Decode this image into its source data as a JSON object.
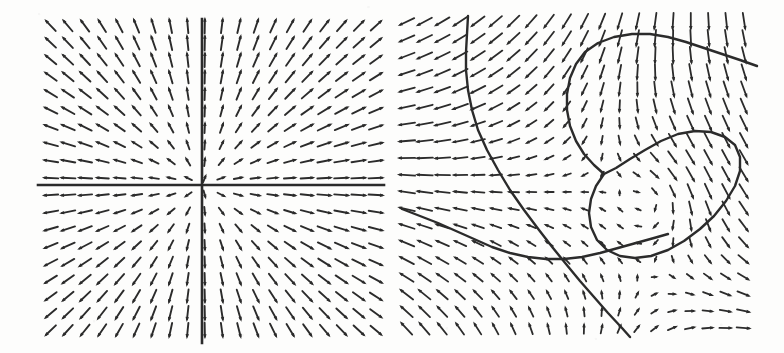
{
  "figure": {
    "kind": "direction-field-pair",
    "background_color": "#fdfdfc",
    "ink_color": "#2b2b2b",
    "width": 784,
    "height": 353,
    "caption": "",
    "title": ""
  },
  "panels": [
    {
      "id": "left",
      "name": "saddle-direction-field",
      "label": "",
      "plot_box": {
        "x": 44,
        "y": 20,
        "w": 336,
        "h": 317
      },
      "axes": {
        "shown": true,
        "x_axis": {
          "y": 185,
          "x_start": 38,
          "x_end": 384,
          "label": ""
        },
        "y_axis": {
          "x": 202,
          "y_start": 19,
          "y_end": 343,
          "label": ""
        }
      },
      "grid": {
        "cols": 20,
        "rows": 19,
        "spacing_x": 17.2,
        "spacing_y": 17.0
      },
      "arrow": {
        "length": 14,
        "head_length": 5,
        "head_width": 3.4,
        "stroke_width": 1.9
      },
      "curves": []
    },
    {
      "id": "right",
      "name": "nonlinear-direction-field-with-trajectories",
      "label": "",
      "plot_box": {
        "x": 402,
        "y": 18,
        "w": 354,
        "h": 318
      },
      "axes": {
        "shown": false
      },
      "grid": {
        "cols": 20,
        "rows": 19,
        "spacing_x": 17.8,
        "spacing_y": 17.0
      },
      "arrow": {
        "length": 14,
        "head_length": 5,
        "head_width": 3.4,
        "stroke_width": 1.8
      },
      "curves": [
        {
          "name": "descending-separatrix",
          "stroke_width": 2.4,
          "points": [
            [
              468,
              16
            ],
            [
              467,
              34
            ],
            [
              466,
              52
            ],
            [
              466,
              70
            ],
            [
              468,
              90
            ],
            [
              472,
              110
            ],
            [
              478,
              130
            ],
            [
              487,
              150
            ],
            [
              498,
              170
            ],
            [
              510,
              190
            ],
            [
              524,
              210
            ],
            [
              539,
              230
            ],
            [
              553,
              248
            ],
            [
              566,
              264
            ],
            [
              580,
              281
            ],
            [
              594,
              297
            ],
            [
              608,
              313
            ],
            [
              622,
              328
            ],
            [
              630,
              337
            ]
          ]
        },
        {
          "name": "upper-hook-curve",
          "stroke_width": 2.4,
          "points": [
            [
              757,
              66
            ],
            [
              740,
              60
            ],
            [
              722,
              54
            ],
            [
              704,
              48
            ],
            [
              686,
              42
            ],
            [
              668,
              37
            ],
            [
              650,
              34
            ],
            [
              632,
              34
            ],
            [
              614,
              37
            ],
            [
              598,
              43
            ],
            [
              585,
              52
            ],
            [
              576,
              64
            ],
            [
              570,
              78
            ],
            [
              567,
              94
            ],
            [
              567,
              110
            ],
            [
              570,
              126
            ],
            [
              576,
              141
            ],
            [
              584,
              154
            ],
            [
              594,
              165
            ],
            [
              604,
              174
            ]
          ]
        },
        {
          "name": "closed-loop-curve",
          "stroke_width": 2.4,
          "closed": true,
          "points": [
            [
              604,
              174
            ],
            [
              596,
              186
            ],
            [
              591,
              199
            ],
            [
              589,
              213
            ],
            [
              591,
              227
            ],
            [
              597,
              240
            ],
            [
              607,
              250
            ],
            [
              620,
              256
            ],
            [
              635,
              258
            ],
            [
              651,
              256
            ],
            [
              668,
              250
            ],
            [
              684,
              241
            ],
            [
              700,
              229
            ],
            [
              714,
              216
            ],
            [
              726,
              201
            ],
            [
              735,
              186
            ],
            [
              740,
              171
            ],
            [
              740,
              157
            ],
            [
              735,
              145
            ],
            [
              725,
              137
            ],
            [
              711,
              132
            ],
            [
              695,
              131
            ],
            [
              678,
              134
            ],
            [
              661,
              141
            ],
            [
              645,
              150
            ],
            [
              630,
              159
            ],
            [
              616,
              168
            ],
            [
              604,
              174
            ]
          ]
        },
        {
          "name": "lower-left-incoming-curve",
          "stroke_width": 2.4,
          "points": [
            [
              402,
              209
            ],
            [
              420,
              216
            ],
            [
              438,
              223
            ],
            [
              456,
              231
            ],
            [
              474,
              239
            ],
            [
              492,
              247
            ],
            [
              510,
              253
            ],
            [
              528,
              257
            ],
            [
              546,
              259
            ],
            [
              564,
              259
            ],
            [
              582,
              257
            ],
            [
              600,
              253
            ],
            [
              618,
              248
            ],
            [
              636,
              243
            ],
            [
              654,
              238
            ],
            [
              668,
              234
            ]
          ]
        }
      ]
    }
  ],
  "chart_data": {
    "type": "scatter",
    "title": "",
    "xlabel": "",
    "ylabel": "",
    "panels": [
      {
        "panel": "left",
        "type": "vector-field",
        "axes_drawn": true,
        "origin_px": [
          202,
          185
        ],
        "grid_cols": 20,
        "grid_rows": 19,
        "field_model": "dx/dt = x, dy/dt = -y (saddle)",
        "quadrant_flow": {
          "upper_left": "down and left (arrows point left-downward)",
          "upper_right": "down and right (arrows point right-downward)",
          "lower_left": "up and left (arrows point left-upward)",
          "lower_right": "up and right (arrows point right-upward)"
        },
        "on_axis_behavior": {
          "x_axis": "arrows horizontal, pointing outward away from origin",
          "y_axis": "arrows vertical, pointing inward toward origin"
        }
      },
      {
        "panel": "right",
        "type": "vector-field-with-trajectories",
        "axes_drawn": false,
        "grid_cols": 20,
        "grid_rows": 19,
        "field_model": "nonlinear planar system with an interior equilibrium and a saddle point near (558, 259) px",
        "equilibria_px": [
          [
            558,
            259
          ],
          [
            665,
            196
          ]
        ],
        "curve_count": 4,
        "curve_names": [
          "descending-separatrix",
          "upper-hook-curve",
          "closed-loop-curve",
          "lower-left-incoming-curve"
        ],
        "region_flow": {
          "top_right": "arrows point left / up-left",
          "top_left": "arrows point down / down-left",
          "bottom_left": "long arrows point up-right",
          "bottom_right": "arrows point up / up-left",
          "loop_interior": "arrows short, rotating (near equilibrium)"
        }
      }
    ]
  }
}
